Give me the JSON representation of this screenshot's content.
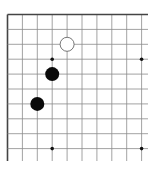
{
  "board": {
    "type": "go-board-fragment",
    "visible_columns": 10,
    "visible_rows": 10,
    "edges": [
      "top",
      "left"
    ],
    "origin_px": [
      7.5,
      14.5
    ],
    "spacing_px": 14.9,
    "extent_px": [
      148,
      161
    ],
    "line_color": "#8a8a8a",
    "edge_color": "#444444",
    "star_points": [
      [
        3,
        3
      ],
      [
        9,
        3
      ],
      [
        3,
        9
      ],
      [
        9,
        9
      ]
    ],
    "stones": [
      {
        "color": "white",
        "col": 4,
        "row": 2
      },
      {
        "color": "black",
        "col": 3,
        "row": 4
      },
      {
        "color": "black",
        "col": 2,
        "row": 6
      }
    ]
  }
}
